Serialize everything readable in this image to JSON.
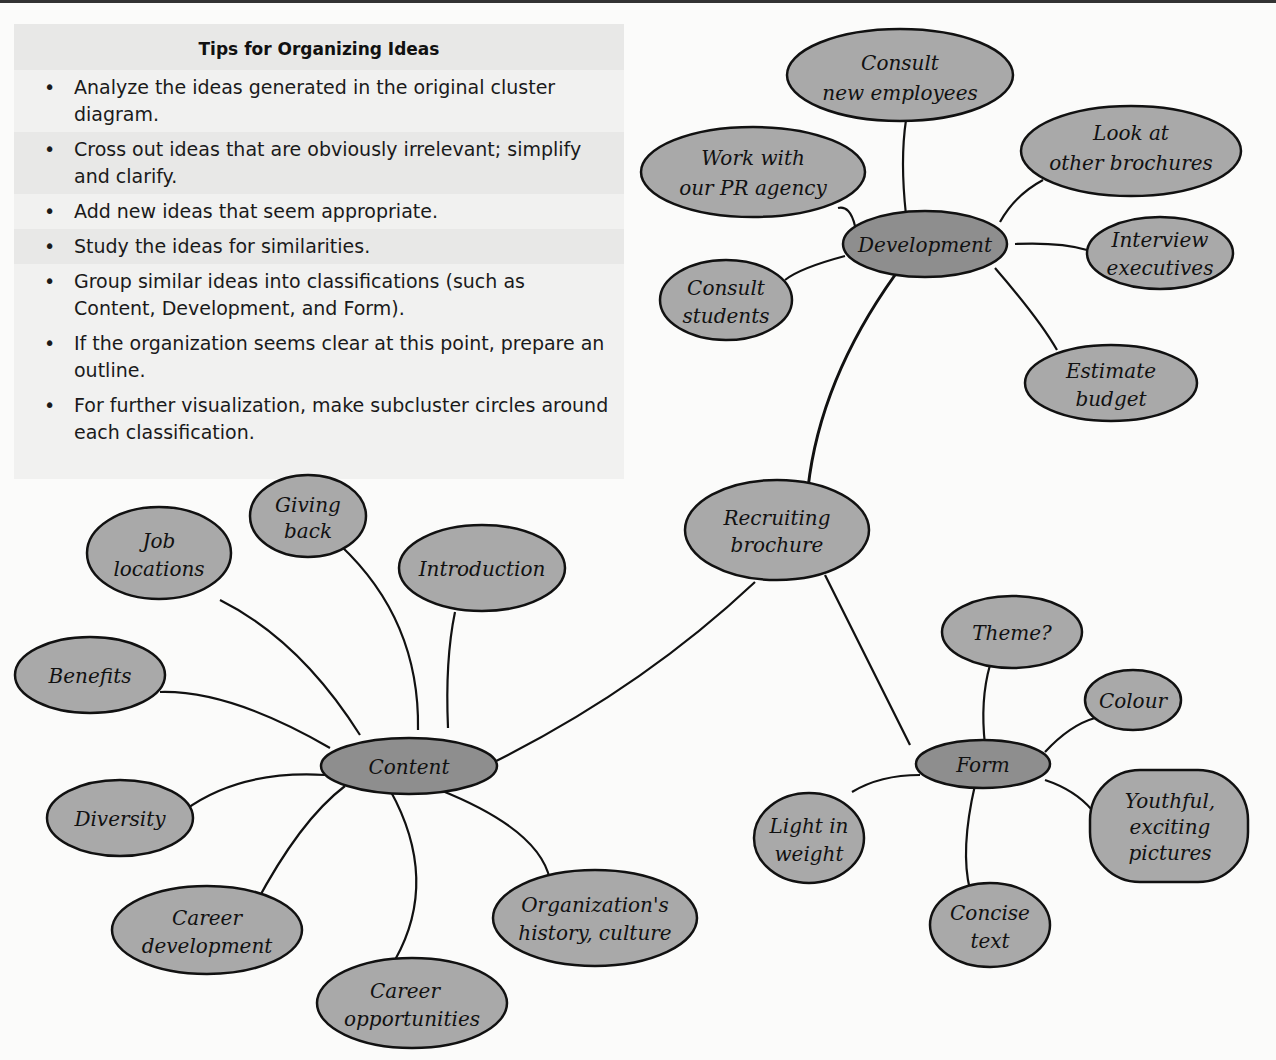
{
  "tips": {
    "title": "Tips for Organizing Ideas",
    "bullet": "•",
    "items": [
      "Analyze the ideas generated in the original cluster diagram.",
      "Cross out ideas that are obviously irrelevant; simplify and clarify.",
      "Add new ideas that seem appropriate.",
      "Study the ideas for similarities.",
      "Group similar ideas into classifications (such as Content, Development, and Form).",
      "If the organization seems clear at this point, prepare an outline.",
      "For further visualization, make subcluster circles around each classification."
    ]
  },
  "diagram": {
    "colors": {
      "leaf_fill": "#a9a9a9",
      "hub_fill": "#8e8e8e",
      "stroke": "#111111"
    },
    "center": {
      "line1": "Recruiting",
      "line2": "brochure"
    },
    "development": {
      "label": "Development",
      "children": [
        {
          "line1": "Consult",
          "line2": "new employees"
        },
        {
          "line1": "Work with",
          "line2": "our PR agency"
        },
        {
          "line1": "Look at",
          "line2": "other brochures"
        },
        {
          "line1": "Interview",
          "line2": "executives"
        },
        {
          "line1": "Consult",
          "line2": "students"
        },
        {
          "line1": "Estimate",
          "line2": "budget"
        }
      ]
    },
    "content": {
      "label": "Content",
      "children": [
        {
          "line1": "Job",
          "line2": "locations"
        },
        {
          "line1": "Giving",
          "line2": "back"
        },
        {
          "line1": "Introduction",
          "line2": ""
        },
        {
          "line1": "Benefits",
          "line2": ""
        },
        {
          "line1": "Diversity",
          "line2": ""
        },
        {
          "line1": "Career",
          "line2": "development"
        },
        {
          "line1": "Career",
          "line2": "opportunities"
        },
        {
          "line1": "Organization's",
          "line2": "history, culture"
        }
      ]
    },
    "form": {
      "label": "Form",
      "children": [
        {
          "line1": "Theme?",
          "line2": ""
        },
        {
          "line1": "Colour",
          "line2": ""
        },
        {
          "line1": "Light in",
          "line2": "weight"
        },
        {
          "line1": "Concise",
          "line2": "text"
        },
        {
          "line1": "Youthful,",
          "line2": "exciting",
          "line3": "pictures"
        }
      ]
    }
  }
}
